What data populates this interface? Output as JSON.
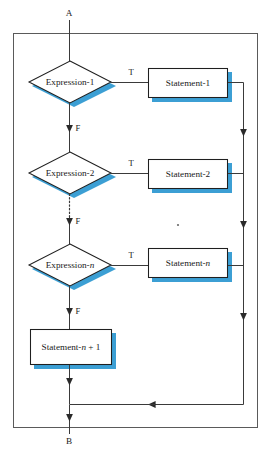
{
  "figure": {
    "type": "flowchart",
    "background_color": "#ffffff",
    "stroke_color": "#1f1f1f",
    "shadow_color": "#3c9fd4",
    "frame_color": "#5a5a5a"
  },
  "terminals": {
    "entry": "A",
    "exit": "B"
  },
  "decisions": [
    {
      "id": "expr1",
      "label": "Expression-1",
      "true_label": "T",
      "false_label": "F"
    },
    {
      "id": "expr2",
      "label": "Expression-2",
      "true_label": "T",
      "false_label": "F"
    },
    {
      "id": "exprn",
      "label": "Expression-",
      "label_italic": "n",
      "true_label": "T",
      "false_label": "F"
    }
  ],
  "processes": [
    {
      "id": "stmt1",
      "label": "Statement-1"
    },
    {
      "id": "stmt2",
      "label": "Statement-2"
    },
    {
      "id": "stmtn",
      "label": "Statement-",
      "label_italic": "n"
    },
    {
      "id": "stmtn1",
      "label_pre": "Statement-",
      "label_italic": "n",
      "label_post": " + 1"
    }
  ],
  "ellipsis": {
    "decision_column": "vertical-dotted",
    "statement_column": "dot"
  },
  "edges": [
    {
      "from": "A",
      "to": "expr1",
      "label": ""
    },
    {
      "from": "expr1",
      "to": "stmt1",
      "label": "T"
    },
    {
      "from": "expr1",
      "to": "expr2",
      "label": "F"
    },
    {
      "from": "expr2",
      "to": "stmt2",
      "label": "T"
    },
    {
      "from": "expr2",
      "to": "exprn",
      "label": "F"
    },
    {
      "from": "exprn",
      "to": "stmtn",
      "label": "T"
    },
    {
      "from": "exprn",
      "to": "stmtn1",
      "label": "F"
    },
    {
      "from": "stmt1",
      "to": "merge",
      "label": ""
    },
    {
      "from": "stmt2",
      "to": "merge",
      "label": ""
    },
    {
      "from": "stmtn",
      "to": "merge",
      "label": ""
    },
    {
      "from": "stmtn1",
      "to": "merge",
      "label": ""
    },
    {
      "from": "merge",
      "to": "B",
      "label": ""
    }
  ]
}
